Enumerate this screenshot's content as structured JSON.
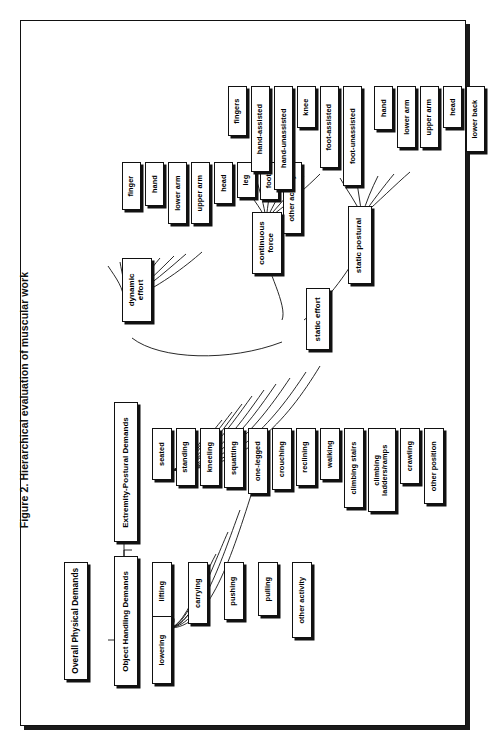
{
  "figure": {
    "caption": "Figure 2.  Hierarchical evaluation of muscular work",
    "caption_label": "Figure 2.",
    "caption_text": "Hierarchical evaluation of muscular work"
  },
  "tree_physical": {
    "root": "Overall Physical Demands",
    "branches": [
      {
        "name": "Object Handling Demands",
        "leaves": [
          "lifting",
          "lowering",
          "carrying",
          "pushing",
          "pulling",
          "other activity"
        ]
      },
      {
        "name": "Extremity-Postural Demands",
        "leaves": [
          "seated",
          "standing",
          "kneeling",
          "squatting",
          "one-legged",
          "crouching",
          "reclining",
          "walking",
          "climbing stairs",
          "climbing ladders/ramps",
          "crawling",
          "other position"
        ]
      }
    ]
  },
  "tree_effort": {
    "dynamic": {
      "name": "dynamic effort",
      "leaves": [
        "finger",
        "hand",
        "lower arm",
        "upper arm",
        "head",
        "leg",
        "foot",
        "other activity"
      ]
    },
    "static": {
      "name": "static effort",
      "children": [
        {
          "name": "continuous force",
          "leaves": [
            "fingers",
            "hand-assisted",
            "hand-unassisted",
            "knee",
            "foot-assisted",
            "foot-unassisted"
          ]
        },
        {
          "name": "static postural",
          "leaves": [
            "hand",
            "lower arm",
            "upper arm",
            "head",
            "lower back"
          ]
        }
      ]
    }
  },
  "colors": {
    "ink": "#111111",
    "paper": "#ffffff",
    "shadow": "#1a1a1a"
  }
}
